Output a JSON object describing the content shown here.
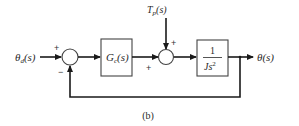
{
  "diagram": {
    "type": "block-diagram",
    "caption": "(b)",
    "input": {
      "label_main": "θ",
      "label_sub": "d",
      "label_arg": "(s)"
    },
    "output": {
      "label_main": "θ",
      "label_arg": "(s)"
    },
    "disturbance": {
      "label_main": "T",
      "label_sub": "p",
      "label_arg": "(s)"
    },
    "controller": {
      "label_main": "G",
      "label_sub": "c",
      "label_arg": "(s)"
    },
    "plant": {
      "numerator": "1",
      "denominator_main": "Js",
      "denominator_exp": "2"
    },
    "summing_junction_1": {
      "input_sign": "+",
      "feedback_sign": "−"
    },
    "summing_junction_2": {
      "controller_sign": "+",
      "disturbance_sign": "+"
    },
    "colors": {
      "line": "#1a1a1a",
      "block_border": "#444444",
      "text": "#2a2a2a",
      "background": "#ffffff"
    }
  }
}
